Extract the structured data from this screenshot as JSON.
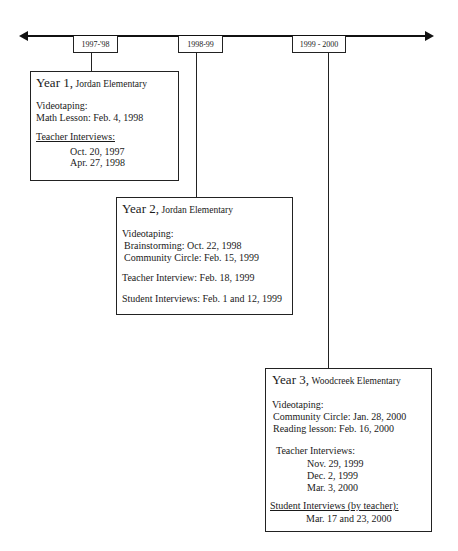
{
  "timeline": {
    "periods": [
      {
        "label": "1997-'98"
      },
      {
        "label": "1998-99"
      },
      {
        "label": "1999 - 2000"
      }
    ]
  },
  "years": [
    {
      "year_label": "Year 1,",
      "school": "Jordan Elementary",
      "videotaping_heading": "Videotaping:",
      "videotaping": [
        "Math Lesson: Feb. 4, 1998"
      ],
      "teacher_heading": "Teacher Interviews:",
      "teacher_dates": [
        "Oct. 20, 1997",
        "Apr. 27, 1998"
      ]
    },
    {
      "year_label": "Year 2,",
      "school": "Jordan Elementary",
      "videotaping_heading": "Videotaping:",
      "videotaping": [
        "Brainstorming: Oct. 22, 1998",
        "Community Circle: Feb. 15, 1999"
      ],
      "teacher_line": "Teacher Interview: Feb. 18, 1999",
      "student_line": "Student Interviews: Feb. 1 and 12, 1999"
    },
    {
      "year_label": "Year 3,",
      "school": "Woodcreek Elementary",
      "videotaping_heading": "Videotaping:",
      "videotaping": [
        "Community Circle: Jan. 28, 2000",
        "Reading lesson: Feb. 16, 2000"
      ],
      "teacher_heading": "Teacher Interviews:",
      "teacher_dates": [
        "Nov. 29, 1999",
        "Dec. 2, 1999",
        "Mar. 3, 2000"
      ],
      "student_heading": "Student Interviews (by teacher):",
      "student_dates": [
        "Mar. 17 and 23, 2000"
      ]
    }
  ]
}
